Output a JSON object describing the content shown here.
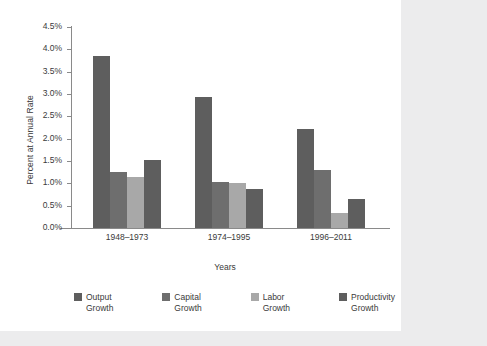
{
  "chart_data": {
    "type": "bar",
    "title": "",
    "xlabel": "Years",
    "ylabel": "Percent at Annual Rate",
    "categories": [
      "1948–1973",
      "1974–1995",
      "1996–2011"
    ],
    "series": [
      {
        "name": "Output\nGrowth",
        "color": "#5e5e5e",
        "values": [
          3.85,
          2.93,
          2.22
        ]
      },
      {
        "name": "Capital\nGrowth",
        "color": "#6e6e6e",
        "values": [
          1.25,
          1.02,
          1.3
        ]
      },
      {
        "name": "Labor\nGrowth",
        "color": "#a8a8a8",
        "values": [
          1.15,
          1.0,
          0.33
        ]
      },
      {
        "name": "Productivity\nGrowth",
        "color": "#5e5e5e",
        "values": [
          1.53,
          0.88,
          0.65
        ]
      }
    ],
    "ylim": [
      0,
      4.5
    ],
    "ytick_values": [
      0.0,
      0.5,
      1.0,
      1.5,
      2.0,
      2.5,
      3.0,
      3.5,
      4.0,
      4.5
    ],
    "ytick_labels": [
      "0.0%",
      "0.5%",
      "1.0%",
      "1.5%",
      "2.0%",
      "2.5%",
      "3.0%",
      "3.5%",
      "4.0%",
      "4.5%"
    ],
    "grid": false,
    "legend_position": "bottom"
  },
  "page": {
    "background_color": "#ececed",
    "panel_color": "#ffffff"
  }
}
